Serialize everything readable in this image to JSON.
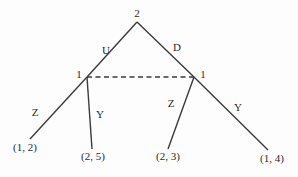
{
  "diagram": {
    "type": "extensive-form-game-tree",
    "nodes": [
      {
        "id": "root",
        "player": "2",
        "x": 137,
        "y": 22,
        "label_x": 137,
        "label_y": 17
      },
      {
        "id": "left",
        "player": "1",
        "x": 87,
        "y": 77,
        "label_x": 79,
        "label_y": 78
      },
      {
        "id": "right",
        "player": "1",
        "x": 194,
        "y": 77,
        "label_x": 203,
        "label_y": 78
      }
    ],
    "edges": [
      {
        "from": "root",
        "to": "left",
        "action": "U",
        "x1": 137,
        "y1": 22,
        "x2": 87,
        "y2": 77,
        "label_x": 106,
        "label_y": 54
      },
      {
        "from": "root",
        "to": "right",
        "action": "D",
        "x1": 137,
        "y1": 22,
        "x2": 194,
        "y2": 77,
        "label_x": 177,
        "label_y": 51
      },
      {
        "from": "left",
        "to": "leaf1",
        "action": "Z",
        "x1": 87,
        "y1": 77,
        "x2": 30,
        "y2": 139,
        "label_x": 35,
        "label_y": 116
      },
      {
        "from": "left",
        "to": "leaf2",
        "action": "Y",
        "x1": 87,
        "y1": 77,
        "x2": 92,
        "y2": 149,
        "label_x": 100,
        "label_y": 118
      },
      {
        "from": "right",
        "to": "leaf3",
        "action": "Z",
        "x1": 194,
        "y1": 77,
        "x2": 168,
        "y2": 149,
        "label_x": 171,
        "label_y": 107
      },
      {
        "from": "right",
        "to": "leaf4",
        "action": "Y",
        "x1": 194,
        "y1": 77,
        "x2": 268,
        "y2": 150,
        "label_x": 238,
        "label_y": 111
      }
    ],
    "information_set": {
      "players": "1",
      "x1": 87,
      "y1": 77,
      "x2": 194,
      "y2": 77,
      "style": "dashed"
    },
    "payoffs": [
      {
        "id": "leaf1",
        "text": "(1, 2)",
        "x": 25,
        "y": 151
      },
      {
        "id": "leaf2",
        "text": "(2, 5)",
        "x": 93,
        "y": 160
      },
      {
        "id": "leaf3",
        "text": "(2, 3)",
        "x": 168,
        "y": 160
      },
      {
        "id": "leaf4",
        "text": "(1, 4)",
        "x": 272,
        "y": 162
      }
    ]
  }
}
